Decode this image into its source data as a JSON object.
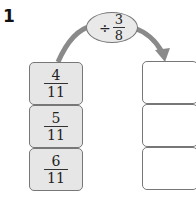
{
  "problem_number": "1",
  "operation": {
    "operator": "÷",
    "numerator": "3",
    "denominator": "8"
  },
  "inputs": [
    {
      "numerator": "4",
      "denominator": "11"
    },
    {
      "numerator": "5",
      "denominator": "11"
    },
    {
      "numerator": "6",
      "denominator": "11"
    }
  ],
  "outputs": [
    "",
    "",
    ""
  ],
  "colors": {
    "input_fill": "#e6e6e6",
    "oval_fill": "#e9e9e9",
    "arrow": "#888888",
    "border": "#777777"
  }
}
